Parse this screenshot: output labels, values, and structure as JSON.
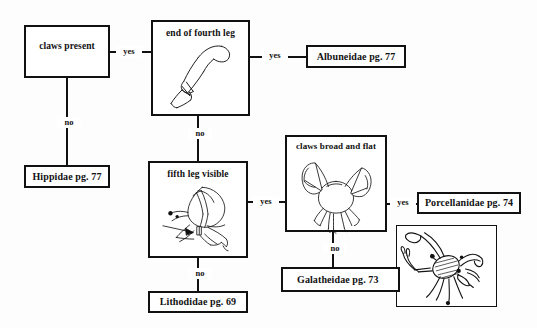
{
  "diagram": {
    "edge_labels": {
      "yes": "yes",
      "no": "no"
    }
  },
  "nodes": {
    "claws_present": {
      "label": "claws present",
      "kind": "question"
    },
    "end_of_fourth_leg": {
      "label": "end of fourth leg",
      "kind": "question",
      "figure": "crab-claw-fourth-leg-drawing"
    },
    "albuneidae": {
      "label": "Albuneidae pg. 77",
      "kind": "terminal"
    },
    "hippidae": {
      "label": "Hippidae pg. 77",
      "kind": "terminal"
    },
    "fifth_leg_visible": {
      "label": "fifth leg visible",
      "kind": "question",
      "figure": "hermit-crab-fifth-leg-drawing"
    },
    "lithodidae": {
      "label": "Lithodidae pg. 69",
      "kind": "terminal"
    },
    "claws_broad_and_flat": {
      "label": "claws broad and flat",
      "kind": "question",
      "figure": "porcelain-crab-drawing"
    },
    "porcellanidae": {
      "label": "Porcellanidae pg. 74",
      "kind": "terminal"
    },
    "galatheidae": {
      "label": "Galatheidae pg. 73",
      "kind": "terminal"
    },
    "squat_lobster_figure": {
      "label": "",
      "kind": "figure",
      "figure": "squat-lobster-drawing"
    }
  },
  "edges": [
    {
      "from": "claws_present",
      "to": "end_of_fourth_leg",
      "label": "yes"
    },
    {
      "from": "claws_present",
      "to": "hippidae",
      "label": "no"
    },
    {
      "from": "end_of_fourth_leg",
      "to": "albuneidae",
      "label": "yes"
    },
    {
      "from": "end_of_fourth_leg",
      "to": "fifth_leg_visible",
      "label": "no"
    },
    {
      "from": "fifth_leg_visible",
      "to": "claws_broad_and_flat",
      "label": "yes"
    },
    {
      "from": "fifth_leg_visible",
      "to": "lithodidae",
      "label": "no"
    },
    {
      "from": "claws_broad_and_flat",
      "to": "porcellanidae",
      "label": "yes"
    },
    {
      "from": "claws_broad_and_flat",
      "to": "galatheidae",
      "label": "no"
    }
  ],
  "colors": {
    "ink": "#111111",
    "paper": "#fdfdfd",
    "box_fill": "#ffffff"
  }
}
